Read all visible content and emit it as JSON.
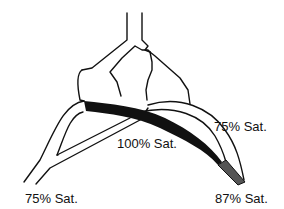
{
  "diagram": {
    "type": "vascular-saturation",
    "labels": {
      "left_vessel": "75% Sat.",
      "center_vessel": "100% Sat.",
      "right_vessel": "75% Sat.",
      "right_tip": "87% Sat."
    },
    "colors": {
      "oxygenated_band": "#111111",
      "mixed_segment": "#555555",
      "outline": "#111111",
      "background": "#ffffff"
    }
  }
}
